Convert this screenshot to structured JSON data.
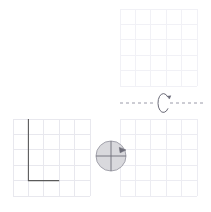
{
  "figure": {
    "type": "rotation-diagram",
    "canvas": {
      "width": 211,
      "height": 212,
      "background": "#ffffff"
    }
  },
  "colors": {
    "grid_light": "#e8e8ee",
    "grid_faint": "#f1f1f6",
    "shape_stroke": "#5a5a5a",
    "axis_dash": "#9a9aa8",
    "arrow_stroke": "#6b6b78",
    "disc_fill": "#d9d9dd",
    "disc_stroke": "#9b9ba5",
    "disc_cross": "#6d6d78"
  },
  "panels": [
    {
      "name": "top-right-grid",
      "label": "Top right answer grid",
      "x": 120,
      "y": 9,
      "cols": 5,
      "rows": 5,
      "cell": 15.4,
      "stroke": "#f1f1f6",
      "contents": "empty"
    },
    {
      "name": "bottom-left-grid",
      "label": "Bottom left grid with triangle",
      "x": 13,
      "y": 119,
      "cols": 5,
      "rows": 5,
      "cell": 15.4,
      "stroke": "#e8e8ee",
      "contents": "triangle"
    },
    {
      "name": "bottom-right-grid",
      "label": "Bottom right answer grid",
      "x": 120,
      "y": 119,
      "cols": 5,
      "rows": 5,
      "cell": 15.4,
      "stroke": "#ececf2",
      "contents": "empty"
    }
  ],
  "shape": {
    "name": "right-triangle",
    "label": "Right triangle",
    "stroke": "#5a5a5a",
    "stroke_width": 1.1,
    "fill": "none",
    "grid_vertices": [
      [
        1,
        0
      ],
      [
        1,
        4
      ],
      [
        3,
        4
      ]
    ],
    "points": "28.4,119 28.4,180.6 59.2,180.6"
  },
  "axis": {
    "name": "rotation-axis",
    "label": "Horizontal rotation axis",
    "y": 103,
    "x_start": 120,
    "x_end": 205,
    "stroke": "#9a9aa8",
    "dash": "3 3",
    "gap_start": 156,
    "gap_end": 170
  },
  "rotation_arrow": {
    "name": "rotation-arrow",
    "label": "Curved rotation arrow about the axis",
    "center_x": 163.5,
    "center_y": 103,
    "rx": 5.5,
    "ry": 9.5,
    "stroke": "#6b6b78",
    "direction": "counterclockwise-about-horizontal-axis",
    "arrowhead": "top-right"
  },
  "disc": {
    "name": "rotation-disc",
    "label": "Shaded disc with crosshair and rotation arrow",
    "cx": 111,
    "cy": 156,
    "r": 15,
    "fill": "#d9d9dd",
    "stroke": "#9b9ba5",
    "cross_stroke": "#6d6d78",
    "arrow_quadrant": "upper-right",
    "arrow_angle_deg": 25
  }
}
